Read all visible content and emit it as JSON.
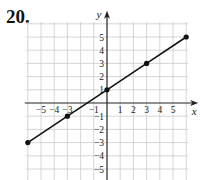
{
  "problem": {
    "number": "20."
  },
  "chart_data": {
    "type": "line",
    "title": "",
    "xlabel": "x",
    "ylabel": "y",
    "xlim": [
      -6,
      6
    ],
    "ylim": [
      -6,
      6
    ],
    "grid": true,
    "x_tick_labels": [
      "−5",
      "−4",
      "−3",
      "−1",
      "1",
      "2",
      "3",
      "4",
      "5"
    ],
    "x_tick_values": [
      -5,
      -4,
      -3,
      -1,
      1,
      2,
      3,
      4,
      5
    ],
    "y_tick_labels": [
      "5",
      "4",
      "3",
      "2",
      "1",
      "−1",
      "−2",
      "−3",
      "−4",
      "−5"
    ],
    "y_tick_values": [
      5,
      4,
      3,
      2,
      1,
      -1,
      -2,
      -3,
      -4,
      -5
    ],
    "series": [
      {
        "name": "line",
        "equation": "y = (2/3)x + 1",
        "points": [
          {
            "x": -6,
            "y": -3
          },
          {
            "x": -3,
            "y": -1
          },
          {
            "x": 0,
            "y": 1
          },
          {
            "x": 3,
            "y": 3
          },
          {
            "x": 6,
            "y": 5
          }
        ]
      }
    ],
    "colors": {
      "line": "#111111",
      "grid": "#cccccc",
      "axis": "#222222"
    }
  }
}
